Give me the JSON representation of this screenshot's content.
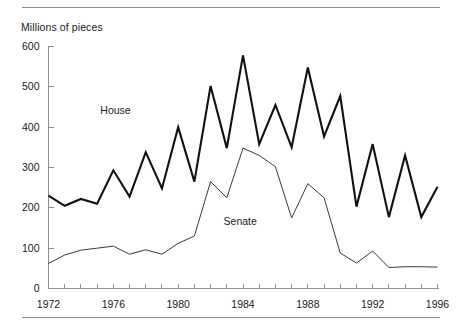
{
  "figure": {
    "y_axis_title": "Millions of pieces",
    "house_label": "House",
    "senate_label": "Senate"
  },
  "chart_data": {
    "type": "line",
    "title": "",
    "subtitle": "",
    "xlabel": "",
    "ylabel": "Millions of pieces",
    "xlim": [
      1972,
      1996
    ],
    "ylim": [
      0,
      600
    ],
    "grid": false,
    "legend": "inline-labels",
    "y_ticks": [
      0,
      100,
      200,
      300,
      400,
      500,
      600
    ],
    "y_tick_labels": [
      "0",
      "100",
      "200",
      "300",
      "400",
      "500",
      "600"
    ],
    "x_ticks": [
      1972,
      1973,
      1974,
      1975,
      1976,
      1977,
      1978,
      1979,
      1980,
      1981,
      1982,
      1983,
      1984,
      1985,
      1986,
      1987,
      1988,
      1989,
      1990,
      1991,
      1992,
      1993,
      1994,
      1995,
      1996
    ],
    "x_tick_labels_shown": [
      "1972",
      "1976",
      "1980",
      "1984",
      "1988",
      "1992",
      "1996"
    ],
    "x": [
      1972,
      1973,
      1974,
      1975,
      1976,
      1977,
      1978,
      1979,
      1980,
      1981,
      1982,
      1983,
      1984,
      1985,
      1986,
      1987,
      1988,
      1989,
      1990,
      1991,
      1992,
      1993,
      1994,
      1995,
      1996
    ],
    "series": [
      {
        "name": "House",
        "values": [
          230,
          205,
          222,
          210,
          293,
          228,
          338,
          248,
          400,
          265,
          502,
          348,
          578,
          358,
          455,
          350,
          548,
          377,
          477,
          203,
          358,
          177,
          330,
          177,
          252
        ]
      },
      {
        "name": "Senate",
        "values": [
          62,
          83,
          95,
          100,
          105,
          85,
          96,
          85,
          112,
          130,
          265,
          225,
          348,
          330,
          302,
          175,
          260,
          225,
          88,
          63,
          93,
          52,
          54,
          54,
          53
        ]
      }
    ],
    "annotations": [
      {
        "text": "House",
        "x": 1975.2,
        "y": 432
      },
      {
        "text": "Senate",
        "x": 1982.8,
        "y": 158
      }
    ]
  }
}
